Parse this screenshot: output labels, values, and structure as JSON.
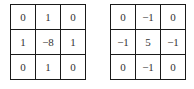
{
  "kernels": [
    {
      "name": "laplacian-8",
      "rows": [
        [
          "0",
          "1",
          "0"
        ],
        [
          "1",
          "−8",
          "1"
        ],
        [
          "0",
          "1",
          "0"
        ]
      ]
    },
    {
      "name": "sharpen",
      "rows": [
        [
          "0",
          "−1",
          "0"
        ],
        [
          "−1",
          "5",
          "−1"
        ],
        [
          "0",
          "−1",
          "0"
        ]
      ]
    }
  ]
}
